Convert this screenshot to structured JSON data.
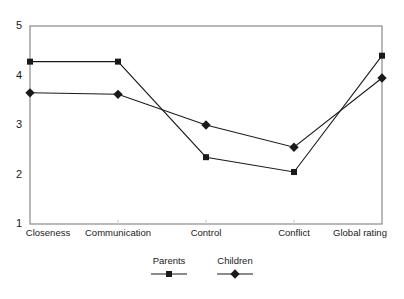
{
  "chart_data": {
    "type": "line",
    "title": "",
    "xlabel": "",
    "ylabel": "",
    "categories": [
      "Closeness",
      "Communication",
      "Control",
      "Conflict",
      "Global rating"
    ],
    "yticks": [
      "5",
      "4",
      "3",
      "2",
      "1"
    ],
    "ylim": [
      1,
      5
    ],
    "grid": false,
    "legend_position": "bottom-center",
    "series": [
      {
        "name": "Parents",
        "marker": "square",
        "color": "#1a1a1a",
        "values": [
          4.28,
          4.28,
          2.35,
          2.05,
          4.4
        ]
      },
      {
        "name": "Children",
        "marker": "diamond",
        "color": "#1a1a1a",
        "values": [
          3.65,
          3.62,
          3.0,
          2.55,
          3.95
        ]
      }
    ]
  },
  "axis": {
    "frame_color": "#7a7a7a",
    "line_color": "#2b2b2b"
  }
}
